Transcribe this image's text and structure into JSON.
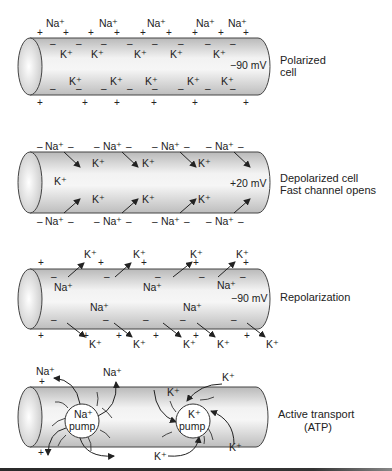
{
  "colors": {
    "cylinder_light": "#f0f0f0",
    "cylinder_dark": "#b8b8b8",
    "stroke": "#444444",
    "text": "#222222"
  },
  "panels": [
    {
      "name": "polarized",
      "label_lines": [
        "Polarized",
        "cell"
      ],
      "voltage": "−90 mV",
      "outside_top": [
        "Na⁺",
        "Na⁺",
        "Na⁺",
        "Na⁺",
        "Na⁺"
      ],
      "inside": [
        "K⁺",
        "K⁺",
        "K⁺",
        "K⁺",
        "K⁺",
        "K⁺",
        "K⁺",
        "K⁺",
        "K⁺",
        "K⁺"
      ]
    },
    {
      "name": "depolarized",
      "label_lines": [
        "Depolarized cell",
        "Fast channel opens"
      ],
      "voltage": "+20 mV",
      "outside_ion": "Na⁺",
      "inside_ion": "K⁺"
    },
    {
      "name": "repolarization",
      "label_lines": [
        "Repolarization"
      ],
      "voltage": "−90 mV",
      "outside_ion": "K⁺",
      "inside_ion": "Na⁺"
    },
    {
      "name": "active-transport",
      "label_lines": [
        "Active transport",
        "(ATP)"
      ],
      "na_pump": [
        "Na⁺",
        "pump"
      ],
      "k_pump": [
        "K⁺",
        "pump"
      ],
      "na_ion": "Na⁺",
      "k_ion": "K⁺"
    }
  ],
  "signs": {
    "plus": "+",
    "minus": "–"
  }
}
